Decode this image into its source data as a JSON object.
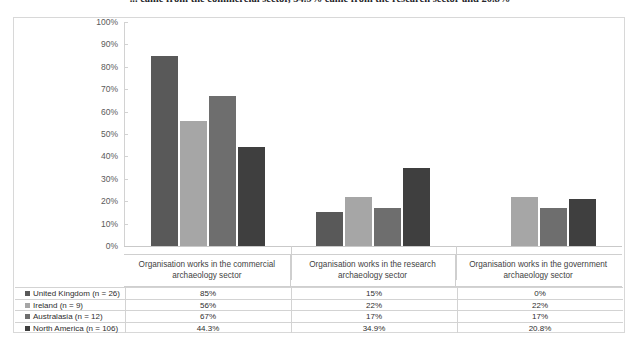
{
  "top_text": "... came from the commercial sector, 34.9% came from the research sector and 20.8%",
  "chart_data": {
    "type": "bar",
    "title": "",
    "xlabel": "",
    "ylabel": "",
    "ylim": [
      0,
      100
    ],
    "y_ticks": [
      "0%",
      "10%",
      "20%",
      "30%",
      "40%",
      "50%",
      "60%",
      "70%",
      "80%",
      "90%",
      "100%"
    ],
    "y_tick_values": [
      0,
      10,
      20,
      30,
      40,
      50,
      60,
      70,
      80,
      90,
      100
    ],
    "grid": false,
    "legend_position": "table-below",
    "categories": [
      "Organisation works in the commercial archaeology sector",
      "Organisation works in the research archaeology sector",
      "Organisation works in the government archaeology sector"
    ],
    "series": [
      {
        "name": "United Kingdom (n = 26)",
        "color": "#595959",
        "values": [
          85,
          15,
          0
        ],
        "labels": [
          "85%",
          "15%",
          "0%"
        ]
      },
      {
        "name": "Ireland (n = 9)",
        "color": "#a6a6a6",
        "values": [
          56,
          22,
          22
        ],
        "labels": [
          "56%",
          "22%",
          "22%"
        ]
      },
      {
        "name": "Australasia (n = 12)",
        "color": "#6e6e6e",
        "values": [
          67,
          17,
          17
        ],
        "labels": [
          "67%",
          "17%",
          "17%"
        ]
      },
      {
        "name": "North America (n = 106)",
        "color": "#3f3f3f",
        "values": [
          44.3,
          34.9,
          20.8
        ],
        "labels": [
          "44.3%",
          "34.9%",
          "20.8%"
        ]
      }
    ]
  }
}
